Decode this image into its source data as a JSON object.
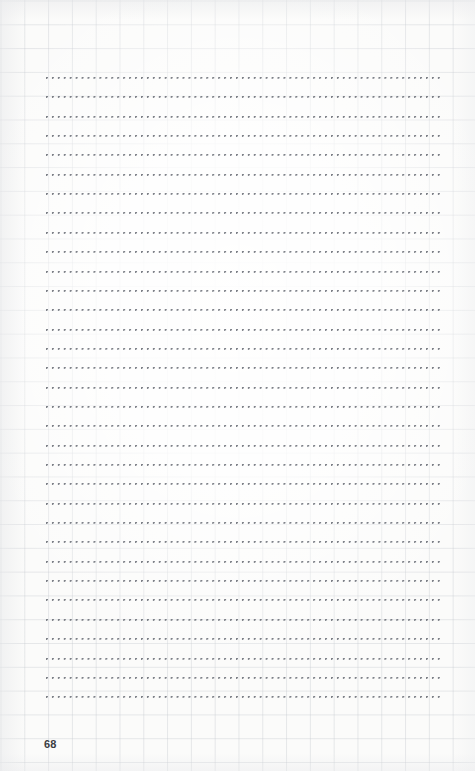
{
  "page": {
    "kind": "notebook-dotted-ruled-page",
    "width": 475,
    "height": 771,
    "background_color": "#fbfbfa",
    "page_number": "68"
  },
  "grid": {
    "name": "graph-paper-grid",
    "visible": true,
    "cell_size_px": 23.8,
    "line_color": "#c4c8ce"
  },
  "ruled_area": {
    "name": "dotted-guide-lines",
    "line_count": 33,
    "first_line_y": 77,
    "line_spacing_px": 19.35,
    "left_x": 46,
    "right_x": 442,
    "dot_color": "#5f636c",
    "dot_spacing_px": 5.95,
    "dot_size_px": 1.6
  },
  "lines": [
    {
      "index": 1,
      "text": ""
    },
    {
      "index": 2,
      "text": ""
    },
    {
      "index": 3,
      "text": ""
    },
    {
      "index": 4,
      "text": ""
    },
    {
      "index": 5,
      "text": ""
    },
    {
      "index": 6,
      "text": ""
    },
    {
      "index": 7,
      "text": ""
    },
    {
      "index": 8,
      "text": ""
    },
    {
      "index": 9,
      "text": ""
    },
    {
      "index": 10,
      "text": ""
    },
    {
      "index": 11,
      "text": ""
    },
    {
      "index": 12,
      "text": ""
    },
    {
      "index": 13,
      "text": ""
    },
    {
      "index": 14,
      "text": ""
    },
    {
      "index": 15,
      "text": ""
    },
    {
      "index": 16,
      "text": ""
    },
    {
      "index": 17,
      "text": ""
    },
    {
      "index": 18,
      "text": ""
    },
    {
      "index": 19,
      "text": ""
    },
    {
      "index": 20,
      "text": ""
    },
    {
      "index": 21,
      "text": ""
    },
    {
      "index": 22,
      "text": ""
    },
    {
      "index": 23,
      "text": ""
    },
    {
      "index": 24,
      "text": ""
    },
    {
      "index": 25,
      "text": ""
    },
    {
      "index": 26,
      "text": ""
    },
    {
      "index": 27,
      "text": ""
    },
    {
      "index": 28,
      "text": ""
    },
    {
      "index": 29,
      "text": ""
    },
    {
      "index": 30,
      "text": ""
    },
    {
      "index": 31,
      "text": ""
    },
    {
      "index": 32,
      "text": ""
    },
    {
      "index": 33,
      "text": ""
    }
  ]
}
